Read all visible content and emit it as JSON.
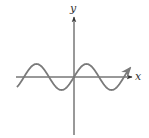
{
  "figure": {
    "axes": {
      "x_label": "x",
      "y_label": "y",
      "x_axis_arrow": "right",
      "y_axis_arrow": "up"
    },
    "curve": {
      "type": "sine",
      "passes_through_origin": true,
      "increasing_at_origin": true,
      "end_arrow": "right",
      "visible_periods": 2.3
    },
    "colors": {
      "axis": "#333333",
      "curve": "#7a7a7a",
      "background": "#ffffff"
    }
  }
}
